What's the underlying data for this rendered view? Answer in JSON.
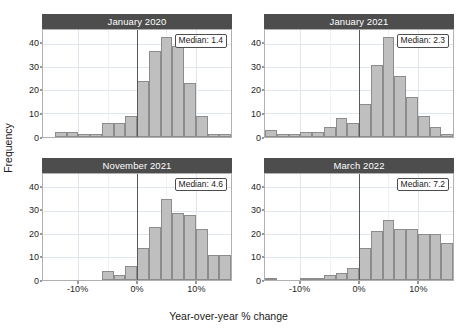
{
  "chart_data": {
    "type": "bar",
    "chart_style": "faceted histogram (2x2 small multiples)",
    "title": "",
    "xlabel": "Year-over-year % change",
    "ylabel": "Frequency",
    "xlim": [
      -16,
      16
    ],
    "ylim": [
      0,
      46
    ],
    "bin_width": 2,
    "grid": true,
    "legend": false,
    "y_ticks": [
      0,
      10,
      20,
      30,
      40
    ],
    "y_tick_labels": [
      "0",
      "10",
      "20",
      "30",
      "40"
    ],
    "x_ticks": [
      -10,
      0,
      10
    ],
    "x_tick_labels": [
      "-10%",
      "0%",
      "10%"
    ],
    "zero_reference_line": 0,
    "panels": [
      {
        "label": "January 2020",
        "annotation": "Median: 1.4",
        "median": 1.4,
        "bin_centers": [
          -15,
          -13,
          -11,
          -9,
          -7,
          -5,
          -3,
          -1,
          1,
          3,
          5,
          7,
          9,
          11,
          13,
          15
        ],
        "values": [
          0,
          2,
          2,
          1,
          1,
          6,
          6,
          9,
          24,
          37,
          43,
          39,
          23,
          9,
          1,
          1
        ]
      },
      {
        "label": "January 2021",
        "annotation": "Median: 2.3",
        "median": 2.3,
        "bin_centers": [
          -15,
          -13,
          -11,
          -9,
          -7,
          -5,
          -3,
          -1,
          1,
          3,
          5,
          7,
          9,
          11,
          13,
          15
        ],
        "values": [
          3,
          1,
          1,
          2,
          2,
          4,
          8,
          6,
          14,
          31,
          43,
          26,
          17,
          9,
          4,
          1
        ]
      },
      {
        "label": "November 2021",
        "annotation": "Median: 4.6",
        "median": 4.6,
        "bin_centers": [
          -15,
          -13,
          -11,
          -9,
          -7,
          -5,
          -3,
          -1,
          1,
          3,
          5,
          7,
          9,
          11,
          13,
          15
        ],
        "values": [
          0,
          0,
          0,
          0,
          0,
          4,
          2,
          6,
          14,
          23,
          35,
          29,
          28,
          22,
          11,
          11
        ]
      },
      {
        "label": "March 2022",
        "annotation": "Median: 7.2",
        "median": 7.2,
        "bin_centers": [
          -15,
          -13,
          -11,
          -9,
          -7,
          -5,
          -3,
          -1,
          1,
          3,
          5,
          7,
          9,
          11,
          13,
          15
        ],
        "values": [
          1,
          0,
          0,
          1,
          1,
          2,
          3,
          5,
          14,
          21,
          26,
          22,
          22,
          20,
          20,
          16
        ]
      }
    ],
    "colors": {
      "bar_fill": "#bfbfbf",
      "bar_outline": "#8c8c8c",
      "strip_background": "#4d4d4d",
      "strip_text": "#ffffff",
      "gridline": "#dfe6ef",
      "panel_border": "#b0b0b0",
      "zero_line": "#595959",
      "background": "#ffffff"
    }
  }
}
